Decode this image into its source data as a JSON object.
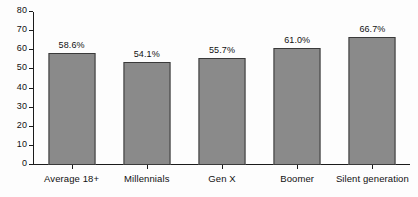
{
  "chart_data": {
    "type": "bar",
    "title": "",
    "subtitle": "",
    "xlabel": "",
    "ylabel": "",
    "ylim": [
      0,
      80
    ],
    "yticks": [
      "0",
      "10",
      "20",
      "30",
      "40",
      "50",
      "60",
      "70",
      "80"
    ],
    "ytick_values": [
      0,
      10,
      20,
      30,
      40,
      50,
      60,
      70,
      80
    ],
    "grid": false,
    "legend": null,
    "categories": [
      "Average 18+",
      "Millennials",
      "Gen X",
      "Boomer",
      "Silent generation"
    ],
    "values": [
      58.6,
      54.1,
      55.7,
      61.0,
      66.7
    ],
    "data_labels": [
      "58.6%",
      "54.1%",
      "55.7%",
      "61.0%",
      "66.7%"
    ],
    "bar_color": "#8a8a8a",
    "bar_edge_color": "#3a3a3a",
    "axis_color": "#1b1b1b",
    "background": "#fdfdfd"
  }
}
